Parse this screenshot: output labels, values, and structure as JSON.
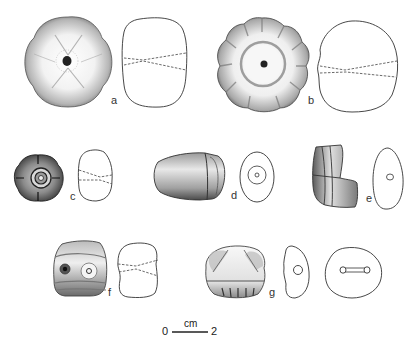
{
  "figure": {
    "items": [
      {
        "label": "a",
        "shape": "four-lobed rounded bead with central perforation",
        "views": [
          "top view (shaded)",
          "side outline with dashed perforation lines"
        ]
      },
      {
        "label": "b",
        "shape": "multi-lobed (melon) bead with concentric ring and central perforation",
        "views": [
          "top view (shaded)",
          "side outline with dashed perforation lines"
        ]
      },
      {
        "label": "c",
        "shape": "small four-lobed bead with concentric rings",
        "views": [
          "top view (shaded)",
          "side outline with dashed perforation lines"
        ]
      },
      {
        "label": "d",
        "shape": "conical/barrel bead",
        "views": [
          "side view (shaded)",
          "end view oval with concentric perforation"
        ]
      },
      {
        "label": "e",
        "shape": "fragmentary segmented bead",
        "views": [
          "side view (shaded)",
          "end view oval with perforation"
        ]
      },
      {
        "label": "f",
        "shape": "rectangular bead with eye motifs",
        "views": [
          "front view (shaded)",
          "side outline with dashed perforation lines"
        ]
      },
      {
        "label": "g",
        "shape": "triangular-faced bead with notched base",
        "views": [
          "front view (shaded)",
          "side section with perforation",
          "top outline with perforation channel"
        ]
      }
    ],
    "scale_bar": {
      "start": "0",
      "end": "2",
      "unit": "cm"
    },
    "colors": {
      "ink": "#2a2a2a",
      "shade": "#8a8a8a",
      "background": "#ffffff"
    }
  }
}
